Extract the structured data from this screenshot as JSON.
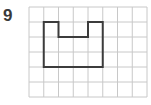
{
  "question": {
    "number": "9"
  },
  "grid": {
    "columns": 8,
    "rows": 6,
    "line_color": "#c8c8c8"
  },
  "shape": {
    "description": "Rectilinear polygon drawn on grid (rectangle with a notch cut from top middle)",
    "stroke_color": "#3c3c3c",
    "vertices_grid_units": [
      [
        1,
        1
      ],
      [
        2,
        1
      ],
      [
        2,
        2
      ],
      [
        4,
        2
      ],
      [
        4,
        1
      ],
      [
        5,
        1
      ],
      [
        5,
        4
      ],
      [
        1,
        4
      ]
    ]
  }
}
